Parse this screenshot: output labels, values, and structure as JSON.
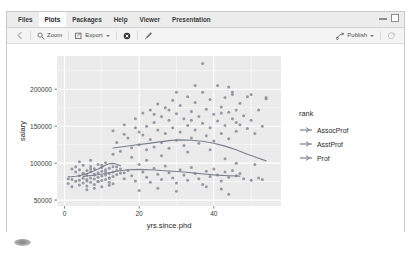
{
  "window": {
    "minimize_icon": "minimize-icon",
    "maximize_icon": "maximize-icon"
  },
  "tabs": [
    {
      "label": "Files",
      "active": false
    },
    {
      "label": "Plots",
      "active": true
    },
    {
      "label": "Packages",
      "active": false
    },
    {
      "label": "Help",
      "active": false
    },
    {
      "label": "Viewer",
      "active": false
    },
    {
      "label": "Presentation",
      "active": false
    }
  ],
  "toolbar": {
    "back_icon": "back-arrow-icon",
    "zoom_label": "Zoom",
    "zoom_icon": "magnifier-icon",
    "export_label": "Export",
    "export_icon": "export-icon",
    "remove_icon": "remove-plot-icon",
    "clear_icon": "clear-all-plots-icon",
    "publish_label": "Publish",
    "publish_icon": "publish-icon",
    "refresh_icon": "refresh-icon"
  },
  "chart_data": {
    "type": "scatter",
    "title": "",
    "xlabel": "yrs.since.phd",
    "ylabel": "salary",
    "xlim": [
      -2,
      58
    ],
    "ylim": [
      42000,
      245000
    ],
    "xticks": [
      0,
      20,
      40
    ],
    "yticks": [
      50000,
      100000,
      150000,
      200000
    ],
    "xtick_labels": [
      "0",
      "20",
      "40"
    ],
    "ytick_labels": [
      "50000",
      "100000",
      "150000",
      "200000"
    ],
    "grid": true,
    "panel_bg": "#ebebeb",
    "grid_color": "#ffffff",
    "point_color": "#8d939e",
    "point_size": 1.5,
    "legend": {
      "title": "rank",
      "position": "right",
      "entries": [
        {
          "label": "AssocProf",
          "color": "#7b8190"
        },
        {
          "label": "AsstProf",
          "color": "#7b8190"
        },
        {
          "label": "Prof",
          "color": "#7b8190"
        }
      ]
    },
    "series": [
      {
        "name": "AsstProf",
        "color": "#7b8190",
        "smooth": [
          [
            1,
            81500
          ],
          [
            2,
            81800
          ],
          [
            3,
            82300
          ],
          [
            4,
            83000
          ],
          [
            5,
            84200
          ],
          [
            6,
            85800
          ],
          [
            7,
            87600
          ],
          [
            8,
            89600
          ],
          [
            9,
            92000
          ],
          [
            10,
            94600
          ],
          [
            11,
            97200
          ],
          [
            12,
            99200
          ],
          [
            13,
            99600
          ],
          [
            14,
            98400
          ],
          [
            15,
            96500
          ]
        ],
        "points": [
          [
            1,
            79000
          ],
          [
            1,
            72500
          ],
          [
            2,
            92000
          ],
          [
            2,
            78000
          ],
          [
            2,
            68000
          ],
          [
            3,
            88000
          ],
          [
            3,
            75500
          ],
          [
            3,
            95000
          ],
          [
            4,
            83000
          ],
          [
            4,
            77000
          ],
          [
            4,
            70500
          ],
          [
            4,
            91000
          ],
          [
            5,
            86000
          ],
          [
            5,
            79500
          ],
          [
            5,
            73000
          ],
          [
            5,
            97000
          ],
          [
            6,
            84000
          ],
          [
            6,
            76000
          ],
          [
            6,
            69000
          ],
          [
            6,
            90000
          ],
          [
            7,
            88500
          ],
          [
            7,
            80000
          ],
          [
            7,
            74000
          ],
          [
            7,
            95500
          ],
          [
            8,
            85000
          ],
          [
            8,
            78500
          ],
          [
            8,
            71000
          ],
          [
            8,
            92500
          ],
          [
            9,
            87000
          ],
          [
            9,
            81000
          ],
          [
            9,
            75000
          ],
          [
            9,
            98000
          ],
          [
            10,
            89000
          ],
          [
            10,
            82500
          ],
          [
            10,
            76500
          ],
          [
            10,
            94000
          ],
          [
            11,
            91000
          ],
          [
            11,
            84000
          ],
          [
            11,
            78000
          ],
          [
            11,
            100500
          ],
          [
            12,
            93000
          ],
          [
            12,
            86000
          ],
          [
            12,
            80000
          ],
          [
            12,
            74000
          ],
          [
            13,
            95000
          ],
          [
            13,
            88000
          ],
          [
            13,
            82000
          ],
          [
            14,
            90000
          ],
          [
            14,
            84500
          ],
          [
            15,
            92000
          ],
          [
            16,
            87000
          ],
          [
            6,
            64000
          ],
          [
            8,
            66000
          ],
          [
            10,
            68000
          ],
          [
            12,
            70000
          ],
          [
            4,
            102000
          ],
          [
            7,
            104000
          ]
        ]
      },
      {
        "name": "AssocProf",
        "color": "#7b8190",
        "smooth": [
          [
            5,
            82000
          ],
          [
            8,
            83500
          ],
          [
            11,
            86000
          ],
          [
            14,
            89000
          ],
          [
            17,
            91000
          ],
          [
            20,
            91500
          ],
          [
            23,
            91000
          ],
          [
            26,
            90000
          ],
          [
            29,
            89000
          ],
          [
            32,
            88000
          ],
          [
            35,
            86500
          ],
          [
            38,
            85000
          ],
          [
            41,
            83800
          ],
          [
            44,
            83000
          ],
          [
            47,
            82500
          ]
        ],
        "points": [
          [
            5,
            86000
          ],
          [
            6,
            78000
          ],
          [
            7,
            92000
          ],
          [
            8,
            84000
          ],
          [
            9,
            75000
          ],
          [
            10,
            97000
          ],
          [
            11,
            88000
          ],
          [
            12,
            80000
          ],
          [
            13,
            72000
          ],
          [
            14,
            95000
          ],
          [
            15,
            86500
          ],
          [
            16,
            79000
          ],
          [
            17,
            90000
          ],
          [
            18,
            83000
          ],
          [
            19,
            76000
          ],
          [
            20,
            98000
          ],
          [
            21,
            88000
          ],
          [
            22,
            81000
          ],
          [
            23,
            74000
          ],
          [
            24,
            93000
          ],
          [
            25,
            85000
          ],
          [
            26,
            78000
          ],
          [
            27,
            96000
          ],
          [
            28,
            87000
          ],
          [
            29,
            80000
          ],
          [
            30,
            73000
          ],
          [
            31,
            91000
          ],
          [
            32,
            84000
          ],
          [
            33,
            77000
          ],
          [
            34,
            94000
          ],
          [
            35,
            86000
          ],
          [
            36,
            79000
          ],
          [
            37,
            71000
          ],
          [
            38,
            89000
          ],
          [
            39,
            82000
          ],
          [
            40,
            92000
          ],
          [
            41,
            84000
          ],
          [
            42,
            76000
          ],
          [
            43,
            88000
          ],
          [
            44,
            81000
          ],
          [
            45,
            90000
          ],
          [
            46,
            83000
          ],
          [
            47,
            86000
          ],
          [
            20,
            63000
          ],
          [
            25,
            66000
          ],
          [
            30,
            62000
          ],
          [
            38,
            68000
          ],
          [
            42,
            65000
          ],
          [
            44,
            58000
          ],
          [
            48,
            79000
          ],
          [
            50,
            77000
          ],
          [
            52,
            80000
          ],
          [
            53,
            78000
          ]
        ]
      },
      {
        "name": "Prof",
        "color": "#7b8190",
        "smooth": [
          [
            13,
            120500
          ],
          [
            16,
            122500
          ],
          [
            19,
            124500
          ],
          [
            22,
            126500
          ],
          [
            25,
            128500
          ],
          [
            28,
            130500
          ],
          [
            31,
            131500
          ],
          [
            34,
            131000
          ],
          [
            37,
            129500
          ],
          [
            40,
            127000
          ],
          [
            43,
            123000
          ],
          [
            46,
            118000
          ],
          [
            49,
            112000
          ],
          [
            52,
            106500
          ],
          [
            54,
            103000
          ]
        ],
        "points": [
          [
            13,
            144000
          ],
          [
            14,
            128000
          ],
          [
            15,
            116000
          ],
          [
            16,
            152000
          ],
          [
            17,
            134000
          ],
          [
            18,
            121000
          ],
          [
            19,
            160000
          ],
          [
            20,
            142000
          ],
          [
            20,
            125000
          ],
          [
            21,
            168000
          ],
          [
            21,
            138000
          ],
          [
            22,
            150000
          ],
          [
            22,
            118000
          ],
          [
            23,
            172000
          ],
          [
            23,
            132000
          ],
          [
            24,
            155000
          ],
          [
            24,
            122000
          ],
          [
            25,
            180000
          ],
          [
            25,
            145000
          ],
          [
            26,
            163000
          ],
          [
            26,
            128000
          ],
          [
            27,
            175000
          ],
          [
            27,
            140000
          ],
          [
            28,
            158000
          ],
          [
            28,
            120000
          ],
          [
            29,
            185000
          ],
          [
            29,
            148000
          ],
          [
            30,
            167000
          ],
          [
            30,
            131000
          ],
          [
            31,
            178000
          ],
          [
            31,
            142000
          ],
          [
            32,
            160000
          ],
          [
            32,
            124000
          ],
          [
            33,
            190000
          ],
          [
            33,
            151000
          ],
          [
            34,
            170000
          ],
          [
            34,
            134000
          ],
          [
            35,
            182000
          ],
          [
            35,
            145000
          ],
          [
            36,
            163000
          ],
          [
            36,
            127000
          ],
          [
            37,
            196000
          ],
          [
            37,
            154000
          ],
          [
            38,
            173000
          ],
          [
            38,
            137000
          ],
          [
            39,
            186000
          ],
          [
            39,
            148000
          ],
          [
            40,
            166000
          ],
          [
            40,
            130000
          ],
          [
            41,
            205000
          ],
          [
            41,
            157000
          ],
          [
            42,
            176000
          ],
          [
            42,
            140000
          ],
          [
            43,
            189000
          ],
          [
            43,
            151000
          ],
          [
            44,
            169000
          ],
          [
            44,
            133000
          ],
          [
            45,
            193000
          ],
          [
            45,
            160000
          ],
          [
            46,
            172000
          ],
          [
            46,
            143000
          ],
          [
            47,
            181000
          ],
          [
            47,
            152000
          ],
          [
            48,
            164000
          ],
          [
            49,
            190000
          ],
          [
            49,
            147000
          ],
          [
            50,
            158000
          ],
          [
            51,
            140000
          ],
          [
            52,
            172000
          ],
          [
            53,
            150000
          ],
          [
            54,
            187000
          ],
          [
            37,
            235000
          ],
          [
            35,
            205000
          ],
          [
            44,
            203000
          ],
          [
            45,
            196000
          ],
          [
            50,
            193000
          ],
          [
            54,
            189000
          ],
          [
            28,
            172000
          ],
          [
            30,
            196000
          ],
          [
            19,
            148000
          ],
          [
            16,
            139000
          ],
          [
            24,
            166000
          ],
          [
            34,
            158000
          ],
          [
            42,
            168000
          ],
          [
            46,
            155000
          ],
          [
            13,
            112000
          ],
          [
            18,
            108000
          ],
          [
            22,
            104000
          ],
          [
            26,
            110000
          ],
          [
            43,
            106000
          ],
          [
            46,
            100000
          ],
          [
            51,
            98000
          ],
          [
            33,
            115000
          ],
          [
            39,
            118000
          ]
        ]
      }
    ]
  }
}
